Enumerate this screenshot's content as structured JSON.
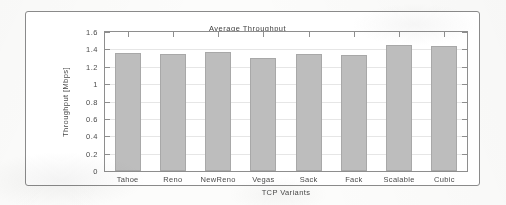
{
  "chart_data": {
    "type": "bar",
    "title": "Average Throughput",
    "xlabel": "TCP Variants",
    "ylabel": "Throughput [Mbps]",
    "categories": [
      "Tahoe",
      "Reno",
      "NewReno",
      "Vegas",
      "Sack",
      "Fack",
      "Scalable",
      "Cubic"
    ],
    "values": [
      1.36,
      1.35,
      1.37,
      1.3,
      1.35,
      1.33,
      1.45,
      1.44
    ],
    "ylim": [
      0,
      1.6
    ],
    "yticks": [
      "0",
      "0.2",
      "0.4",
      "0.6",
      "0.8",
      "1",
      "1.2",
      "1.4",
      "1.6"
    ],
    "ytick_values": [
      0,
      0.2,
      0.4,
      0.6,
      0.8,
      1,
      1.2,
      1.4,
      1.6
    ],
    "grid": true,
    "legend_position": "top-center",
    "bar_color": "#bdbdbd",
    "axis_color": "#8e8e8e",
    "grid_color": "#e6e6e6",
    "text_color": "#4a4a4a"
  }
}
